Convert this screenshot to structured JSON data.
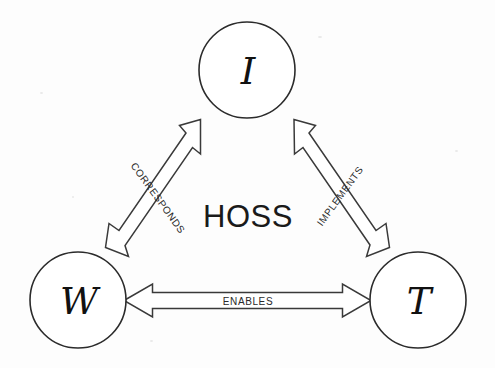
{
  "diagram": {
    "center_label": "HOSS",
    "background_color": "#fdfdfd",
    "line_color": "#3a3a3a",
    "nodes": [
      {
        "id": "information",
        "letter": "I",
        "cx": 247,
        "cy": 70,
        "r": 48
      },
      {
        "id": "world",
        "letter": "W",
        "cx": 78,
        "cy": 300,
        "r": 48
      },
      {
        "id": "technology",
        "letter": "T",
        "cx": 418,
        "cy": 300,
        "r": 48
      }
    ],
    "edges": [
      {
        "id": "corresponds",
        "label": "CORRESPONDS",
        "from": "world",
        "to": "information",
        "bidirectional": true,
        "label_x": 158,
        "label_y": 198,
        "label_rotation": 54
      },
      {
        "id": "implements",
        "label": "IMPLEMENTS",
        "from": "information",
        "to": "technology",
        "bidirectional": true,
        "label_x": 340,
        "label_y": 196,
        "label_rotation": -54
      },
      {
        "id": "enables",
        "label": "ENABLES",
        "from": "world",
        "to": "technology",
        "bidirectional": true,
        "label_x": 248,
        "label_y": 301,
        "label_rotation": 0
      }
    ]
  }
}
